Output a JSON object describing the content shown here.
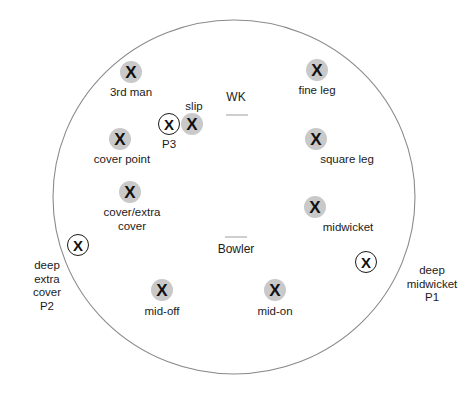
{
  "diagram": {
    "boundary": {
      "name": "field-boundary",
      "stroke_color": "#8a8a8a",
      "fill_color": "#ffffff",
      "cx": 234,
      "cy": 197,
      "rx": 181,
      "ry": 177
    },
    "marker_styles": {
      "fielder_fill": "#c9c9c9",
      "deep_ring_stroke": "#1a1a1a",
      "x_glyph": "X",
      "text_color": "#1b1b1b",
      "crease_color": "#cfcfcf"
    }
  },
  "pitch": {
    "wicketkeeper": {
      "label": "WK",
      "x": 236,
      "y": 98,
      "crease_x": 237,
      "crease_y": 114
    },
    "bowler": {
      "label": "Bowler",
      "x": 236,
      "y": 243,
      "crease_x": 236,
      "crease_y": 236
    }
  },
  "fielders": [
    {
      "id": "third-man",
      "label": "3rd man",
      "type": "filled",
      "mx": 131,
      "my": 72,
      "lx": 131,
      "ly": 86
    },
    {
      "id": "fine-leg",
      "label": "fine leg",
      "type": "filled",
      "mx": 317,
      "my": 70,
      "lx": 317,
      "ly": 84
    },
    {
      "id": "slip",
      "label": "slip",
      "type": "filled",
      "mx": 192,
      "my": 124,
      "lx": 194,
      "ly": 100
    },
    {
      "id": "p3",
      "label": "P3",
      "type": "ring",
      "mx": 169,
      "my": 124,
      "lx": 169,
      "ly": 138
    },
    {
      "id": "cover-point",
      "label": "cover point",
      "type": "filled",
      "mx": 120,
      "my": 139,
      "lx": 122,
      "ly": 153
    },
    {
      "id": "square-leg",
      "label": "square leg",
      "type": "filled",
      "mx": 316,
      "my": 139,
      "lx": 347,
      "ly": 153
    },
    {
      "id": "cover-extra-cover",
      "label": "cover/extra\ncover",
      "type": "filled",
      "mx": 130,
      "my": 192,
      "lx": 132,
      "ly": 206
    },
    {
      "id": "midwicket",
      "label": "midwicket",
      "type": "filled",
      "mx": 315,
      "my": 207,
      "lx": 348,
      "ly": 221
    },
    {
      "id": "deep-extra-cover",
      "label": "deep\nextra\ncover\nP2",
      "type": "ring",
      "mx": 78,
      "my": 245,
      "lx": 47,
      "ly": 259
    },
    {
      "id": "deep-midwicket",
      "label": "deep\nmidwicket\nP1",
      "type": "ring",
      "mx": 366,
      "my": 262,
      "lx": 432,
      "ly": 264
    },
    {
      "id": "mid-off",
      "label": "mid-off",
      "type": "filled",
      "mx": 162,
      "my": 290,
      "lx": 162,
      "ly": 305
    },
    {
      "id": "mid-on",
      "label": "mid-on",
      "type": "filled",
      "mx": 275,
      "my": 290,
      "lx": 275,
      "ly": 305
    }
  ]
}
